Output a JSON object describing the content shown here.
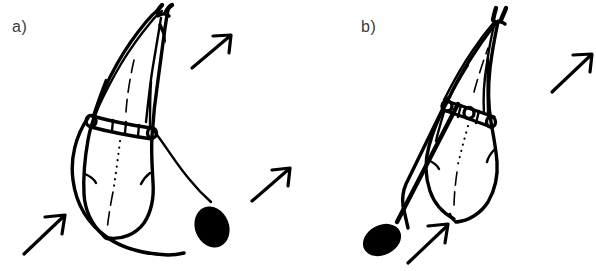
{
  "figure": {
    "background_color": "#ffffff",
    "ink_color": "#000000",
    "label_color": "#3b3b3b",
    "width": 596,
    "height": 271
  },
  "panels": [
    {
      "id": "a",
      "label": "a)",
      "label_position": {
        "x": 12,
        "y": 18
      },
      "description": "Squid in upright-oblique posture with slack curved tether trailing to a solid black ellipse",
      "parts": {
        "mantle": "mantle-outline",
        "fins": "terminal-fins",
        "harness": "harness-band",
        "rings": 3,
        "tether": "slack-curved-tether",
        "blob": "solid-black-ellipse"
      },
      "blob": {
        "cx": 212,
        "cy": 227,
        "rx": 17,
        "ry": 21,
        "rotation": -22
      },
      "arrows": [
        {
          "name": "arrow-upper-right",
          "x1": 192,
          "y1": 68,
          "x2": 230,
          "y2": 36,
          "direction": "up-right"
        },
        {
          "name": "arrow-middle-right",
          "x1": 252,
          "y1": 200,
          "x2": 288,
          "y2": 170,
          "direction": "up-right"
        },
        {
          "name": "arrow-lower-left",
          "x1": 24,
          "y1": 253,
          "x2": 63,
          "y2": 216,
          "direction": "up-right"
        }
      ]
    },
    {
      "id": "b",
      "label": "b)",
      "label_position": {
        "x": 63,
        "y": 18
      },
      "description": "Squid tilted along a taut straight tether running down-left to a solid black ellipse",
      "parts": {
        "mantle": "mantle-outline",
        "fins": "terminal-fins",
        "harness": "harness-band",
        "rings": 3,
        "tether": "taut-straight-tether",
        "blob": "solid-black-ellipse"
      },
      "blob": {
        "cx": 84,
        "cy": 240,
        "rx": 20,
        "ry": 15,
        "rotation": -27
      },
      "arrows": [
        {
          "name": "arrow-upper-right",
          "x1": 254,
          "y1": 92,
          "x2": 292,
          "y2": 55,
          "direction": "up-right"
        },
        {
          "name": "arrow-lower-left",
          "x1": 110,
          "y1": 262,
          "x2": 147,
          "y2": 226,
          "direction": "up-right"
        }
      ]
    }
  ]
}
